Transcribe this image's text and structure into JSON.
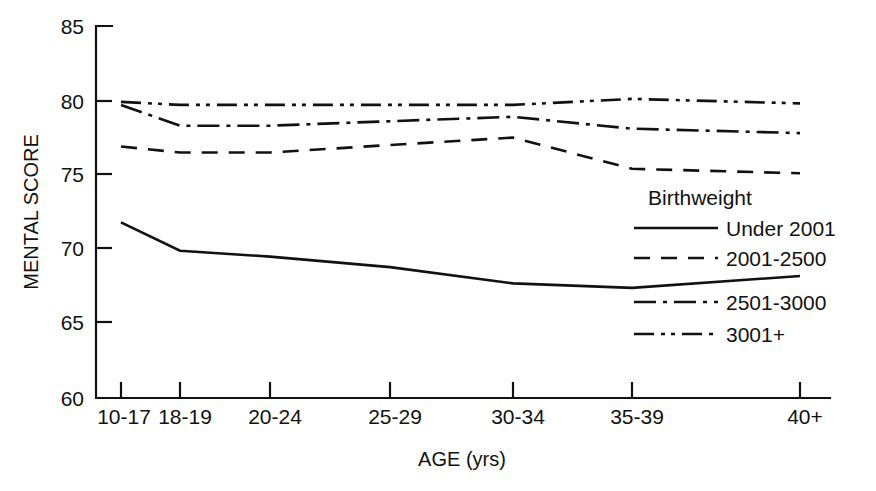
{
  "chart_data": {
    "type": "line",
    "title": "",
    "xlabel": "AGE (yrs)",
    "ylabel": "MENTAL SCORE",
    "categories": [
      "10-17",
      "18-19",
      "20-24",
      "25-29",
      "30-34",
      "35-39",
      "40+"
    ],
    "ylim": [
      60,
      85
    ],
    "yticks": [
      60,
      65,
      70,
      75,
      80,
      85
    ],
    "ytick_labels": [
      "60",
      "65",
      "70",
      "75",
      "80",
      "85"
    ],
    "grid": false,
    "legend_position": "right-inside",
    "legend_title": "Birthweight",
    "series": [
      {
        "name": "Under 2001",
        "style": "solid",
        "values": [
          71.8,
          69.9,
          69.5,
          68.8,
          67.7,
          67.4,
          68.2
        ]
      },
      {
        "name": "2001-2500",
        "style": "dashed",
        "values": [
          76.9,
          76.5,
          76.5,
          77.0,
          77.5,
          75.4,
          75.1
        ]
      },
      {
        "name": "2501-3000",
        "style": "dash-dot",
        "values": [
          79.7,
          78.3,
          78.3,
          78.6,
          78.9,
          78.1,
          77.8
        ]
      },
      {
        "name": "3001+",
        "style": "dash-dot-dot",
        "values": [
          79.9,
          79.7,
          79.7,
          79.7,
          79.7,
          80.1,
          79.8
        ]
      }
    ]
  },
  "axes": {
    "y_axis_label": "MENTAL SCORE",
    "x_axis_label": "AGE (yrs)",
    "y_tick_labels": [
      "85",
      "80",
      "75",
      "70",
      "65",
      "60"
    ],
    "x_tick_labels": [
      "10-17",
      "18-19",
      "20-24",
      "25-29",
      "30-34",
      "35-39",
      "40+"
    ]
  },
  "legend": {
    "title": "Birthweight",
    "entries": [
      {
        "label": "Under 2001",
        "style": "solid"
      },
      {
        "label": "2001-2500",
        "style": "dashed"
      },
      {
        "label": "2501-3000",
        "style": "dash-dot"
      },
      {
        "label": "3001+",
        "style": "dash-dot-dot"
      }
    ]
  },
  "colors": {
    "ink": "#111111",
    "background": "#ffffff"
  }
}
